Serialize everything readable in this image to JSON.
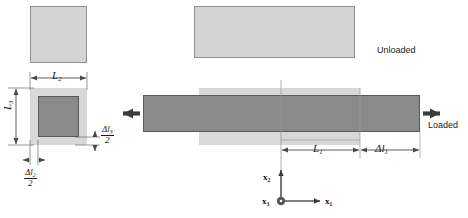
{
  "figure": {
    "type": "engineering-deformation-diagram",
    "colors": {
      "unloaded_fill": "#d4d4d4",
      "unloaded_stroke": "#8e8e8e",
      "loaded_fill": "#8a8a8a",
      "loaded_stroke": "#5a5a5a",
      "dimension_line": "#4a4a4a",
      "axis": "#555555",
      "text": "#1a1a1a",
      "background": "#ffffff"
    }
  },
  "labels": {
    "unloaded": "Unloaded",
    "loaded": "Loaded",
    "L1": "L",
    "L1_sub": "1",
    "L2": "L",
    "L2_sub": "2",
    "L3": "L",
    "L3_sub": "3",
    "dl1": "Δl",
    "dl1_sub": "1",
    "dl2_num": "Δl",
    "dl2_sub": "2",
    "dl2_den": "2",
    "dl3_num": "Δl",
    "dl3_sub": "3",
    "dl3_den": "2"
  },
  "axes": {
    "x1": "x",
    "x1_sub": "1",
    "x2": "x",
    "x2_sub": "2",
    "x3": "x",
    "x3_sub": "3",
    "x3_note": "out-of-page"
  },
  "views": {
    "cross_section_unloaded": {
      "name": "unloaded square cross-section",
      "state": "unloaded"
    },
    "cross_section_loaded": {
      "name": "loaded square cross-section",
      "state": "loaded, contracted laterally"
    },
    "side_unloaded": {
      "name": "unloaded bar side view",
      "state": "unloaded"
    },
    "side_loaded": {
      "name": "loaded bar side view",
      "state": "loaded, elongated axially"
    }
  }
}
